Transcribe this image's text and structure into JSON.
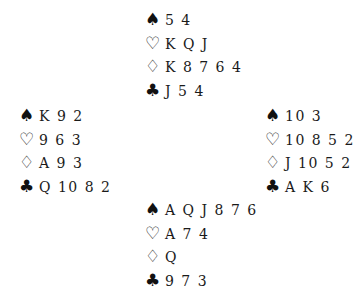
{
  "hands": {
    "north": {
      "spades": "5 4",
      "hearts": "K Q J",
      "diamonds": "K 8 7 6 4",
      "clubs": "J 5 4"
    },
    "west": {
      "spades": "K 9 2",
      "hearts": "9 6 3",
      "diamonds": "A 9 3",
      "clubs": "Q 10 8 2"
    },
    "east": {
      "spades": "10 3",
      "hearts": "10 8 5 2",
      "diamonds": "J 10 5 2",
      "clubs": "A K 6"
    },
    "south": {
      "spades": "A Q J 8 7 6",
      "hearts": "A 7 4",
      "diamonds": "Q",
      "clubs": "9 7 3"
    }
  },
  "suit_symbols": {
    "spades": "♠",
    "hearts": "♡",
    "diamonds": "♢",
    "clubs": "♣"
  }
}
